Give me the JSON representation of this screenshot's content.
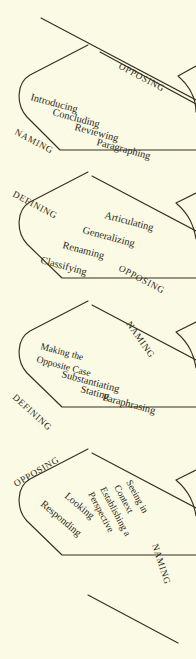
{
  "diagram": {
    "background_color": "#fbfae4",
    "ink_color": "#35301f",
    "bands": [
      {
        "id": "band-1",
        "top_edge_label": "OPPOSING",
        "bottom_edge_label": "NAMING",
        "items": [
          "Introducing",
          "Concluding",
          "Reviewing",
          "Paragraphing"
        ]
      },
      {
        "id": "band-2",
        "top_edge_label": "DEFINING",
        "bottom_edge_label": "OPPOSING",
        "items": [
          "Articulating",
          "Generalizing",
          "Renaming",
          "Classifying"
        ]
      },
      {
        "id": "band-3",
        "top_edge_label": "NAMING",
        "bottom_edge_label": "DEFINING",
        "items": [
          "Making the",
          "Opposite Case",
          "Substantiating",
          "Stating",
          "Paraphrasing"
        ]
      },
      {
        "id": "band-4",
        "top_edge_label": "OPPOSING",
        "bottom_edge_label": "NAMING",
        "items": [
          "Seeing in",
          "Context",
          "Establishing a",
          "Perspective",
          "Looking",
          "Responding"
        ]
      }
    ]
  }
}
